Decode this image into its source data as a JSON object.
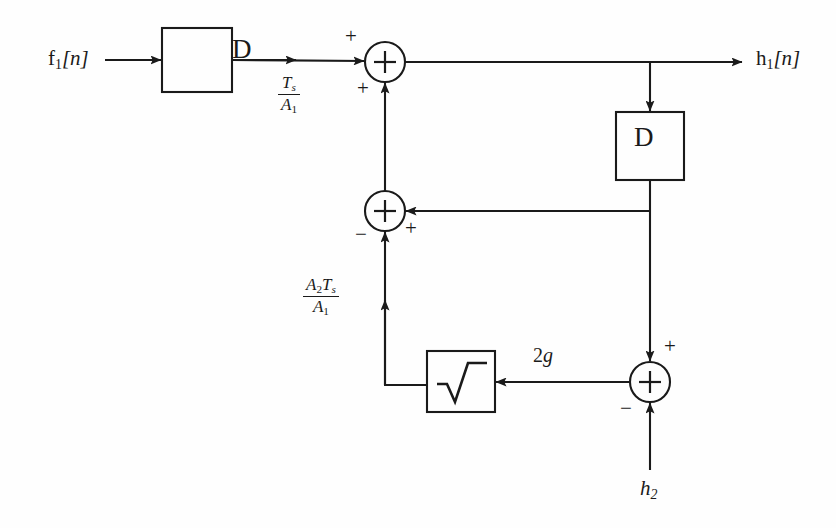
{
  "diagram": {
    "type": "signal-flow-block-diagram",
    "stroke_color": "#1a1a1a",
    "background_color": "#fefefe",
    "blocks": [
      {
        "id": "delay-1",
        "label": "D",
        "x": 162,
        "y": 28,
        "w": 70,
        "h": 64
      },
      {
        "id": "delay-2",
        "label": "D",
        "x": 616,
        "y": 112,
        "w": 68,
        "h": 68
      },
      {
        "id": "sqrt",
        "label": "sqrt-radical-icon",
        "x": 427,
        "y": 351,
        "w": 68,
        "h": 61
      }
    ],
    "adders": [
      {
        "id": "adder-top",
        "label": "+",
        "cx": 385,
        "cy": 62,
        "r": 20
      },
      {
        "id": "adder-middle",
        "label": "+",
        "cx": 385,
        "cy": 211,
        "r": 20
      },
      {
        "id": "adder-bottom",
        "label": "+",
        "cx": 650,
        "cy": 382,
        "r": 20
      }
    ],
    "signals": {
      "input_1": "f₁[n]",
      "input_1_base": "f",
      "input_1_sub": "1",
      "input_1_index": "[n]",
      "input_2_base": "h",
      "input_2_sub": "2",
      "output_base": "h",
      "output_sub": "1",
      "output_index": "[n]"
    },
    "gains": [
      {
        "id": "gain-ts-a1",
        "numerator_base": "T",
        "numerator_sub": "s",
        "denominator_base": "A",
        "denominator_sub": "1",
        "x": 278,
        "y": 74
      },
      {
        "id": "gain-a2ts-a1",
        "numerator_a_base": "A",
        "numerator_a_sub": "2",
        "numerator_b_base": "T",
        "numerator_b_sub": "s",
        "denominator_base": "A",
        "denominator_sub": "1",
        "x": 303,
        "y": 276
      },
      {
        "id": "gain-2g",
        "coefficient": "2",
        "variable": "g",
        "x": 533,
        "y": 345
      }
    ],
    "signs": {
      "adder_top_horizontal": "+",
      "adder_top_vertical": "+",
      "adder_middle_horizontal": "+",
      "adder_middle_vertical": "−",
      "adder_bottom_top": "+",
      "adder_bottom_bottom": "−"
    }
  }
}
